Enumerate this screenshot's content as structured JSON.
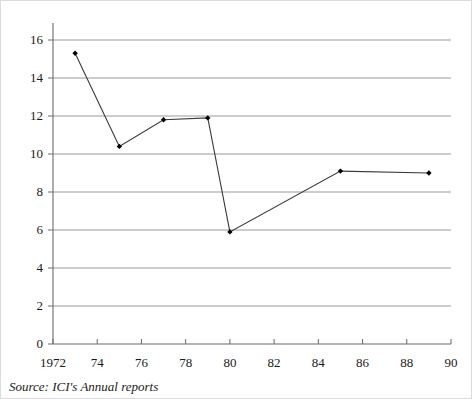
{
  "figure": {
    "source_note": "Source: ICI's Annual reports"
  },
  "axes": {
    "y_ticks": [
      "0",
      "2",
      "4",
      "6",
      "8",
      "10",
      "12",
      "14",
      "16"
    ],
    "x_ticks": [
      "1972",
      "74",
      "76",
      "78",
      "80",
      "82",
      "84",
      "86",
      "88",
      "90"
    ]
  },
  "colors": {
    "line": "#3b3b3b",
    "marker": "#000000",
    "gridline": "#9a9a9a",
    "axis": "#6b6b6b",
    "text": "#1a1a1a",
    "background": "#ffffff"
  },
  "chart_data": {
    "type": "line",
    "title": "",
    "subtitle": "",
    "xlabel": "",
    "ylabel": "",
    "xlim": [
      1972,
      1990
    ],
    "ylim": [
      0,
      16
    ],
    "grid": true,
    "legend": false,
    "x_tick_values": [
      1972,
      1974,
      1976,
      1978,
      1980,
      1982,
      1984,
      1986,
      1988,
      1990
    ],
    "x_tick_labels": [
      "1972",
      "74",
      "76",
      "78",
      "80",
      "82",
      "84",
      "86",
      "88",
      "90"
    ],
    "y_tick_values": [
      0,
      2,
      4,
      6,
      8,
      10,
      12,
      14,
      16
    ],
    "y_tick_labels": [
      "0",
      "2",
      "4",
      "6",
      "8",
      "10",
      "12",
      "14",
      "16"
    ],
    "markers": "diamond",
    "series": [
      {
        "name": "",
        "x": [
          1973,
          1975,
          1977,
          1979,
          1980,
          1985,
          1989
        ],
        "values": [
          15.3,
          10.4,
          11.8,
          11.9,
          5.9,
          9.1,
          9.0
        ]
      }
    ],
    "annotations": [
      "Source: ICI's Annual reports"
    ]
  }
}
